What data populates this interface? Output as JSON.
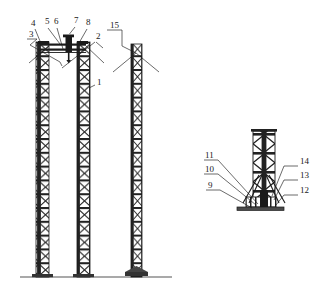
{
  "figure": {
    "type": "patent-line-drawing",
    "title": "",
    "background_color": "#ffffff",
    "line_color": "#1a1a1a",
    "hatch_color": "#222222"
  },
  "main_view": {
    "name": "elevation-view",
    "ground_line": {
      "x1": 20,
      "x2": 172,
      "y": 277
    },
    "towers": [
      {
        "id": "tower-left",
        "label_ref": "3",
        "x": 36,
        "top": 42,
        "bottom": 277,
        "width": 13,
        "segments": 17
      },
      {
        "id": "tower-middle",
        "label_ref": "1",
        "x": 77,
        "top": 42,
        "bottom": 277,
        "width": 13,
        "segments": 17
      },
      {
        "id": "tower-right",
        "label_ref": "15",
        "x": 131,
        "top": 44,
        "bottom": 277,
        "width": 11,
        "segments": 17
      }
    ],
    "crosshead": {
      "name": "top-beam-assembly",
      "x1": 40,
      "x2": 86,
      "y": 44,
      "hoist_x": 69,
      "hoist_top": 36,
      "hoist_bottom": 62
    }
  },
  "detail_view": {
    "name": "base-detail-view",
    "tower": {
      "x": 253,
      "top": 131,
      "bottom": 207,
      "width": 22,
      "segments": 4
    },
    "base_plate": {
      "x1": 238,
      "x2": 283,
      "y": 208
    },
    "footing": {
      "x1": 244,
      "x2": 276,
      "y1": 198,
      "y2": 207
    }
  },
  "callouts": {
    "top_group": [
      {
        "number": "4",
        "tx": 31,
        "ty": 26
      },
      {
        "number": "5",
        "tx": 45,
        "ty": 24
      },
      {
        "number": "6",
        "tx": 54,
        "ty": 24
      },
      {
        "number": "7",
        "tx": 74,
        "ty": 23
      },
      {
        "number": "8",
        "tx": 86,
        "ty": 25
      },
      {
        "number": "3",
        "tx": 29,
        "ty": 37
      },
      {
        "number": "2",
        "tx": 96,
        "ty": 39
      },
      {
        "number": "1",
        "tx": 97,
        "ty": 85
      },
      {
        "number": "15",
        "tx": 110,
        "ty": 28
      }
    ],
    "detail_left": [
      {
        "number": "11",
        "tx": 205,
        "ty": 158
      },
      {
        "number": "10",
        "tx": 205,
        "ty": 172
      },
      {
        "number": "9",
        "tx": 208,
        "ty": 188
      }
    ],
    "detail_right": [
      {
        "number": "14",
        "tx": 300,
        "ty": 164
      },
      {
        "number": "13",
        "tx": 300,
        "ty": 178
      },
      {
        "number": "12",
        "tx": 300,
        "ty": 193
      }
    ]
  }
}
